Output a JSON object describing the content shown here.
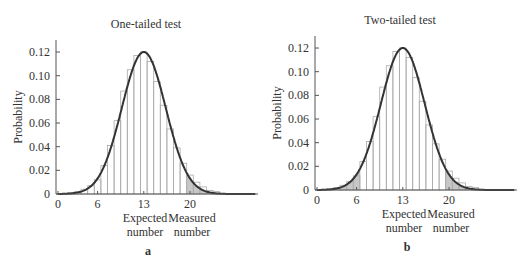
{
  "chart_data": [
    {
      "type": "bar",
      "panel_label": "a",
      "title": "One-tailed test",
      "xlabel": "",
      "ylabel": "Probability",
      "ylim": [
        0,
        0.13
      ],
      "xlim": [
        0,
        30
      ],
      "yticks": [
        "0",
        "0.02",
        "0.04",
        "0.06",
        "0.08",
        "0.10",
        "0.12"
      ],
      "xticks": [
        "0",
        "6",
        "13",
        "20"
      ],
      "annotations": [
        {
          "text": "Expected",
          "line2": "number",
          "x": 13
        },
        {
          "text": "Measured",
          "line2": "number",
          "x": 20
        }
      ],
      "categories": [
        1,
        2,
        3,
        4,
        5,
        6,
        7,
        8,
        9,
        10,
        11,
        12,
        13,
        14,
        15,
        16,
        17,
        18,
        19,
        20,
        21,
        22,
        23,
        24
      ],
      "values": [
        0.0005,
        0.001,
        0.002,
        0.004,
        0.007,
        0.012,
        0.024,
        0.041,
        0.062,
        0.087,
        0.105,
        0.117,
        0.12,
        0.112,
        0.095,
        0.075,
        0.055,
        0.039,
        0.026,
        0.016,
        0.01,
        0.006,
        0.003,
        0.002
      ],
      "curve": {
        "type": "normal",
        "mean": 13,
        "sd": 3.33,
        "peak": 0.12
      },
      "shaded_region": {
        "from": 20,
        "to": 30,
        "description": "upper tail"
      }
    },
    {
      "type": "bar",
      "panel_label": "b",
      "title": "Two-tailed test",
      "xlabel": "",
      "ylabel": "Probability",
      "ylim": [
        0,
        0.13
      ],
      "xlim": [
        0,
        30
      ],
      "yticks": [
        "0",
        "0.02",
        "0.04",
        "0.06",
        "0.08",
        "0.10",
        "0.12"
      ],
      "xticks": [
        "0",
        "6",
        "13",
        "20"
      ],
      "annotations": [
        {
          "text": "Expected",
          "line2": "number",
          "x": 13
        },
        {
          "text": "Measured",
          "line2": "number",
          "x": 20
        }
      ],
      "categories": [
        1,
        2,
        3,
        4,
        5,
        6,
        7,
        8,
        9,
        10,
        11,
        12,
        13,
        14,
        15,
        16,
        17,
        18,
        19,
        20,
        21,
        22,
        23,
        24
      ],
      "values": [
        0.0005,
        0.001,
        0.002,
        0.004,
        0.007,
        0.012,
        0.024,
        0.041,
        0.062,
        0.087,
        0.105,
        0.117,
        0.12,
        0.112,
        0.095,
        0.075,
        0.055,
        0.039,
        0.026,
        0.016,
        0.01,
        0.006,
        0.003,
        0.002
      ],
      "curve": {
        "type": "normal",
        "mean": 13,
        "sd": 3.33,
        "peak": 0.12
      },
      "shaded_region": [
        {
          "from": 0,
          "to": 6,
          "description": "lower tail"
        },
        {
          "from": 20,
          "to": 30,
          "description": "upper tail"
        }
      ]
    }
  ],
  "panels": {
    "a": {
      "title": "One-tailed test",
      "label": "a",
      "ylabel": "Probability",
      "expected_1": "Expected",
      "expected_2": "number",
      "measured_1": "Measured",
      "measured_2": "number"
    },
    "b": {
      "title": "Two-tailed test",
      "label": "b",
      "ylabel": "Probability",
      "expected_1": "Expected",
      "expected_2": "number",
      "measured_1": "Measured",
      "measured_2": "number"
    }
  },
  "colors": {
    "axis": "#555555",
    "curve": "#333333",
    "bar_edge": "#aaaaaa",
    "shade": "#bdbdbd"
  }
}
